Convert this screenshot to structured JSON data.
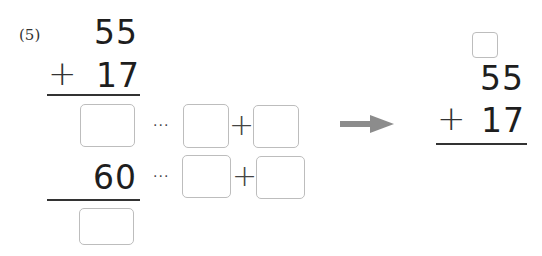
{
  "problem": {
    "number_label": "(5)",
    "vertical_left": {
      "addend_top": "55",
      "operator": "+",
      "addend_bottom": "17",
      "partial_sum_known": "60"
    },
    "decomposition_rows": [
      {
        "ellipsis": "···",
        "plus": "+",
        "boxes": [
          "",
          ""
        ]
      },
      {
        "ellipsis": "···",
        "plus": "+",
        "boxes": [
          "",
          ""
        ]
      }
    ],
    "answer_boxes": {
      "first_partial": "",
      "final_sum": ""
    },
    "arrow": {
      "direction": "right",
      "color": "#8c8c8c"
    },
    "vertical_right": {
      "carry_box": "",
      "addend_top": "55",
      "operator": "+",
      "addend_bottom": "17"
    }
  }
}
